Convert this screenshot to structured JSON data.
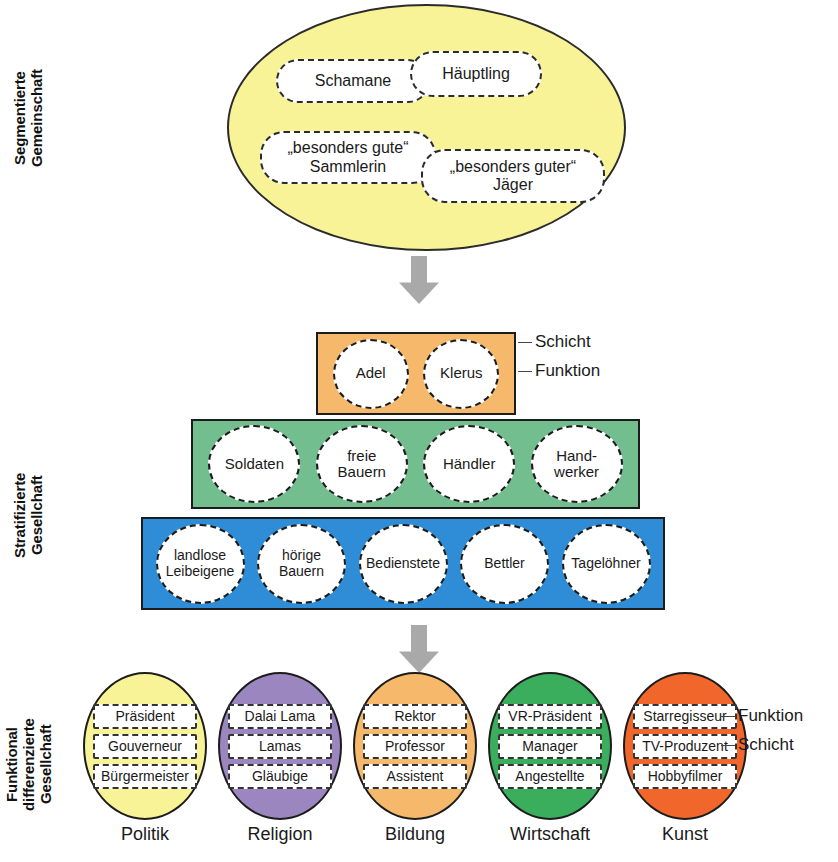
{
  "diagram": {
    "side_labels": [
      {
        "id": "segmentiert",
        "text": "Segmentierte\nGemeinschaft"
      },
      {
        "id": "stratifiziert",
        "text": "Stratifizierte\nGesellchaft"
      },
      {
        "id": "funktional",
        "text": "Funktional\ndifferenzierte\nGesellchaft"
      }
    ],
    "segmented_community": {
      "fill": "#F7F396",
      "roles": [
        {
          "id": "schamane",
          "label": "Schamane"
        },
        {
          "id": "haeuptling",
          "label": "Häuptling"
        },
        {
          "id": "sammlerin",
          "label": "„besonders gute“\nSammlerin"
        },
        {
          "id": "jaeger",
          "label": "„besonders guter“\nJäger"
        }
      ]
    },
    "stratified_layers": [
      {
        "id": "nobility",
        "fill": "#F6B96C",
        "roles": [
          {
            "label": "Adel"
          },
          {
            "label": "Klerus"
          }
        ]
      },
      {
        "id": "middle",
        "fill": "#73BE8E",
        "roles": [
          {
            "label": "Soldaten"
          },
          {
            "label": "freie\nBauern"
          },
          {
            "label": "Händler"
          },
          {
            "label": "Hand-\nwerker"
          }
        ]
      },
      {
        "id": "lower",
        "fill": "#2F8CD6",
        "roles": [
          {
            "label": "landlose\nLeibeigene"
          },
          {
            "label": "hörige\nBauern"
          },
          {
            "label": "Bedienstete"
          },
          {
            "label": "Bettler"
          },
          {
            "label": "Tagelöhner"
          }
        ]
      }
    ],
    "callouts": {
      "schicht_top": "Schicht",
      "funktion_top": "Funktion",
      "funktion_bottom": "Funktion",
      "schicht_bottom": "Schicht"
    },
    "functional_systems": [
      {
        "id": "politik",
        "name": "Politik",
        "fill": "#F7F396",
        "slots": [
          "Präsident",
          "Gouverneur",
          "Bürgermeister"
        ]
      },
      {
        "id": "religion",
        "name": "Religion",
        "fill": "#9C86C0",
        "slots": [
          "Dalai Lama",
          "Lamas",
          "Gläubige"
        ]
      },
      {
        "id": "bildung",
        "name": "Bildung",
        "fill": "#F6B96C",
        "slots": [
          "Rektor",
          "Professor",
          "Assistent"
        ]
      },
      {
        "id": "wirtschaft",
        "name": "Wirtschaft",
        "fill": "#3AAE5C",
        "slots": [
          "VR-Präsident",
          "Manager",
          "Angestellte"
        ]
      },
      {
        "id": "kunst",
        "name": "Kunst",
        "fill": "#F1672B",
        "slots": [
          "Starregisseur",
          "TV-Produzent",
          "Hobbyfilmer"
        ]
      }
    ],
    "arrows": [
      {
        "id": "top",
        "direction": "down"
      },
      {
        "id": "bottom",
        "direction": "down"
      }
    ]
  }
}
